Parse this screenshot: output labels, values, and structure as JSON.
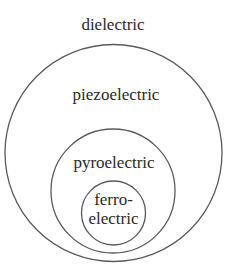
{
  "diagram": {
    "type": "nested-set (Euler) diagram",
    "title": "",
    "sets": [
      {
        "label": "dielectric",
        "level": 0
      },
      {
        "label": "piezoelectric",
        "level": 1
      },
      {
        "label": "pyroelectric",
        "level": 2
      },
      {
        "label_line1": "ferro-",
        "label_line2": "electric",
        "level": 3
      }
    ],
    "colors": {
      "stroke": "#5a5a5a",
      "text": "#2a2a2a",
      "background": "#ffffff"
    }
  }
}
